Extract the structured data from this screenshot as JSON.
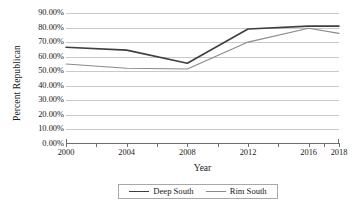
{
  "chart_data": {
    "type": "line",
    "title": "",
    "xlabel": "Year",
    "ylabel": "Percent Republican",
    "x": [
      2000,
      2002,
      2004,
      2006,
      2008,
      2010,
      2012,
      2014,
      2016,
      2017,
      2018
    ],
    "categories": [
      "2000",
      "2002",
      "2004",
      "2006",
      "2008",
      "2010",
      "2012",
      "2014",
      "2016",
      "2017",
      "2018"
    ],
    "xtick_labels": [
      "2000",
      "2004",
      "2008",
      "2012",
      "2016",
      "2018"
    ],
    "xtick_label_values": [
      2000,
      2004,
      2008,
      2012,
      2016,
      2018
    ],
    "ytick_labels": [
      "0.00%",
      "10.00%",
      "20.00%",
      "30.00%",
      "40.00%",
      "50.00%",
      "60.00%",
      "70.00%",
      "80.00%",
      "90.00%"
    ],
    "ytick_values": [
      0,
      10,
      20,
      30,
      40,
      50,
      60,
      70,
      80,
      90
    ],
    "ylim": [
      0,
      90
    ],
    "xlim": [
      2000,
      2018
    ],
    "grid": "horizontal",
    "legend_position": "bottom",
    "series": [
      {
        "name": "Deep South",
        "color": "#3f3f3f",
        "line_width": 1.6,
        "x": [
          2000,
          2004,
          2008,
          2012,
          2016,
          2018
        ],
        "values": [
          66.5,
          64.5,
          55.5,
          79.0,
          81.0,
          81.0
        ]
      },
      {
        "name": "Rim South",
        "color": "#8a8a8a",
        "line_width": 1.1,
        "x": [
          2000,
          2004,
          2008,
          2012,
          2016,
          2018
        ],
        "values": [
          55.0,
          52.0,
          51.5,
          70.0,
          79.5,
          76.0
        ]
      }
    ]
  },
  "axes": {
    "y_title": "Percent Republican",
    "x_title": "Year"
  },
  "legend": {
    "items": [
      {
        "label": "Deep South"
      },
      {
        "label": "Rim South"
      }
    ]
  },
  "colors": {
    "deep_south": "#3f3f3f",
    "rim_south": "#8a8a8a",
    "gridline": "#c9c9c9",
    "axis": "#6e6e6e",
    "background": "#ffffff",
    "text": "#1a1a1a"
  }
}
